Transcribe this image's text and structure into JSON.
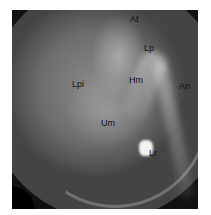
{
  "image": {
    "description": "Grayscale otoscopic image of tympanic membrane with anatomical labels",
    "labels": {
      "at": "At",
      "lp": "Lp",
      "lpi": "Lpi",
      "hm": "Hm",
      "an": "An",
      "um": "Um",
      "lr": "Lr"
    }
  }
}
